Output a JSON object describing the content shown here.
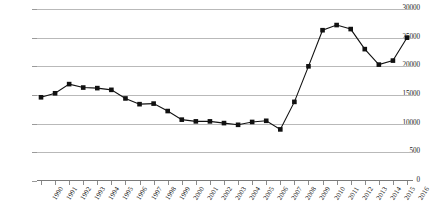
{
  "chart_data": {
    "type": "line",
    "title": "",
    "subtitle": "",
    "xlabel": "",
    "ylabel": "",
    "grid": true,
    "legend": false,
    "legend_position": "none",
    "marker": "square",
    "line_color": "#111111",
    "marker_color": "#111111",
    "grid_color": "#b9b9b9",
    "ylim": [
      0,
      30000
    ],
    "ytick_labels": [
      "30000",
      "25000",
      "20000",
      "15000",
      "10000",
      "500",
      "0"
    ],
    "ytick_values": [
      30000,
      25000,
      20000,
      15000,
      10000,
      5000,
      0
    ],
    "categories": [
      "1990",
      "1991",
      "1992",
      "1993",
      "1994",
      "1995",
      "1996",
      "1997",
      "1998",
      "1999",
      "2000",
      "2001",
      "2002",
      "2003",
      "2004",
      "2005",
      "2006",
      "2007",
      "2008",
      "2009",
      "2010",
      "2011",
      "2012",
      "2013",
      "2014",
      "2015",
      "2016"
    ],
    "values": [
      14600,
      15300,
      16900,
      16300,
      16200,
      15900,
      14400,
      13400,
      13500,
      12200,
      10700,
      10400,
      10400,
      10100,
      9800,
      10300,
      10500,
      9000,
      13800,
      20000,
      26300,
      27200,
      26500,
      23000,
      20300,
      21000,
      25000
    ],
    "series": [
      {
        "name": "series-1",
        "values": [
          14600,
          15300,
          16900,
          16300,
          16200,
          15900,
          14400,
          13400,
          13500,
          12200,
          10700,
          10400,
          10400,
          10100,
          9800,
          10300,
          10500,
          9000,
          13800,
          20000,
          26300,
          27200,
          26500,
          23000,
          20300,
          21000,
          25000
        ]
      }
    ],
    "annotations": []
  },
  "colors": {
    "background": "#ffffff",
    "axis": "#7a7a7a",
    "grid": "#b9b9b9",
    "text": "#1a1a1a",
    "series": "#111111"
  }
}
